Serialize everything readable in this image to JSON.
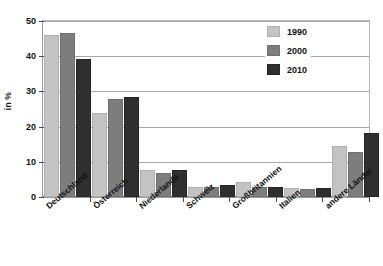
{
  "chart_data": {
    "type": "bar",
    "title": "",
    "subtitle": "",
    "xlabel": "",
    "ylabel": "in %",
    "ylim": [
      0,
      50
    ],
    "yticks": [
      0,
      10,
      20,
      30,
      40,
      50
    ],
    "ytick_labels": [
      "0",
      "10",
      "20",
      "30",
      "40",
      "50"
    ],
    "grid": "horizontal",
    "legend_position": "top-right",
    "categories": [
      "Deutschland",
      "Österreich",
      "Niederlande",
      "Schweiz",
      "Großbritannien",
      "Italien",
      "andere Länder"
    ],
    "series": [
      {
        "name": "1990",
        "color": "#c3c3c3",
        "values": [
          45.5,
          23.2,
          7.1,
          2.3,
          3.6,
          2.0,
          13.8
        ]
      },
      {
        "name": "2000",
        "color": "#7d7d7d",
        "values": [
          46.0,
          27.3,
          6.3,
          2.2,
          2.3,
          1.8,
          12.1
        ]
      },
      {
        "name": "2010",
        "color": "#2f2f2f",
        "values": [
          38.5,
          27.9,
          7.1,
          2.8,
          2.2,
          2.0,
          17.5
        ]
      }
    ]
  },
  "axis": {
    "y_title": "in %"
  },
  "legend": {
    "items": [
      {
        "label": "1990"
      },
      {
        "label": "2000"
      },
      {
        "label": "2010"
      }
    ]
  }
}
